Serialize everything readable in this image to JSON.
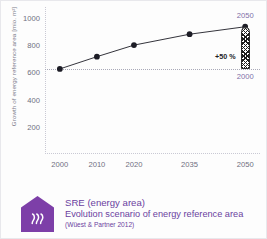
{
  "chart_data": {
    "type": "line",
    "title": "",
    "xlabel": "",
    "ylabel": "Growth of energy reference area [mio. m²]",
    "categories": [
      "2000",
      "2010",
      "2020",
      "2035",
      "2050"
    ],
    "x": [
      2000,
      2010,
      2020,
      2035,
      2050
    ],
    "values": [
      625,
      715,
      800,
      880,
      935
    ],
    "ylim": [
      0,
      1080
    ],
    "xlim": [
      1996,
      2054
    ],
    "y_ticks": [
      1000,
      800,
      600,
      400,
      200
    ],
    "y_tick_labels": [
      "1000",
      "800",
      "600",
      "400",
      "200"
    ],
    "x_ticks": [
      2000,
      2010,
      2020,
      2035,
      2050
    ],
    "x_tick_labels": [
      "2000",
      "2010",
      "2020",
      "2035",
      "2050"
    ],
    "grid": false,
    "legend": null,
    "reference_line": {
      "value": 625,
      "style": "dotted",
      "label": "2000"
    },
    "annotations": [
      {
        "name": "bar-top-year",
        "text": "2050",
        "value": 935
      },
      {
        "name": "bar-bottom-year",
        "text": "2000",
        "value": 625
      },
      {
        "name": "growth-delta",
        "text": "+50 %",
        "value": 50
      }
    ],
    "comparison_bar": {
      "name": "growth-bar",
      "at_x": 2050,
      "from": 625,
      "to": 935,
      "fill": "hatched",
      "delta_label": "+50 %"
    },
    "marker": "filled-circle",
    "line_color": "#1d1d26",
    "marker_color": "#1d1d26"
  },
  "caption": {
    "logo_icon": "house-waves-icon",
    "title": "SRE (energy area)",
    "subtitle": "Evolution scenario of energy reference area",
    "source": "(Wüest & Partner 2012)"
  },
  "colors": {
    "brand_purple": "#6b3fa0",
    "logo_purple": "#7d3fa8",
    "axis_grey": "#c9c9d4",
    "tick_text": "#6f6f80",
    "series_black": "#1d1d26",
    "annotation_purple": "#7d6fa8",
    "page_background": "#fdfdfd"
  }
}
